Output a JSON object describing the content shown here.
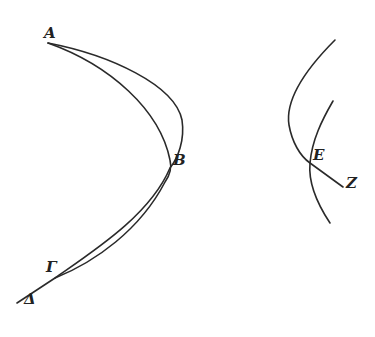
{
  "diagram": {
    "stroke_color": "#2a2a2a",
    "labels": {
      "A": "A",
      "B": "B",
      "G": "Γ",
      "D": "Δ",
      "E": "E",
      "Z": "Z"
    }
  }
}
